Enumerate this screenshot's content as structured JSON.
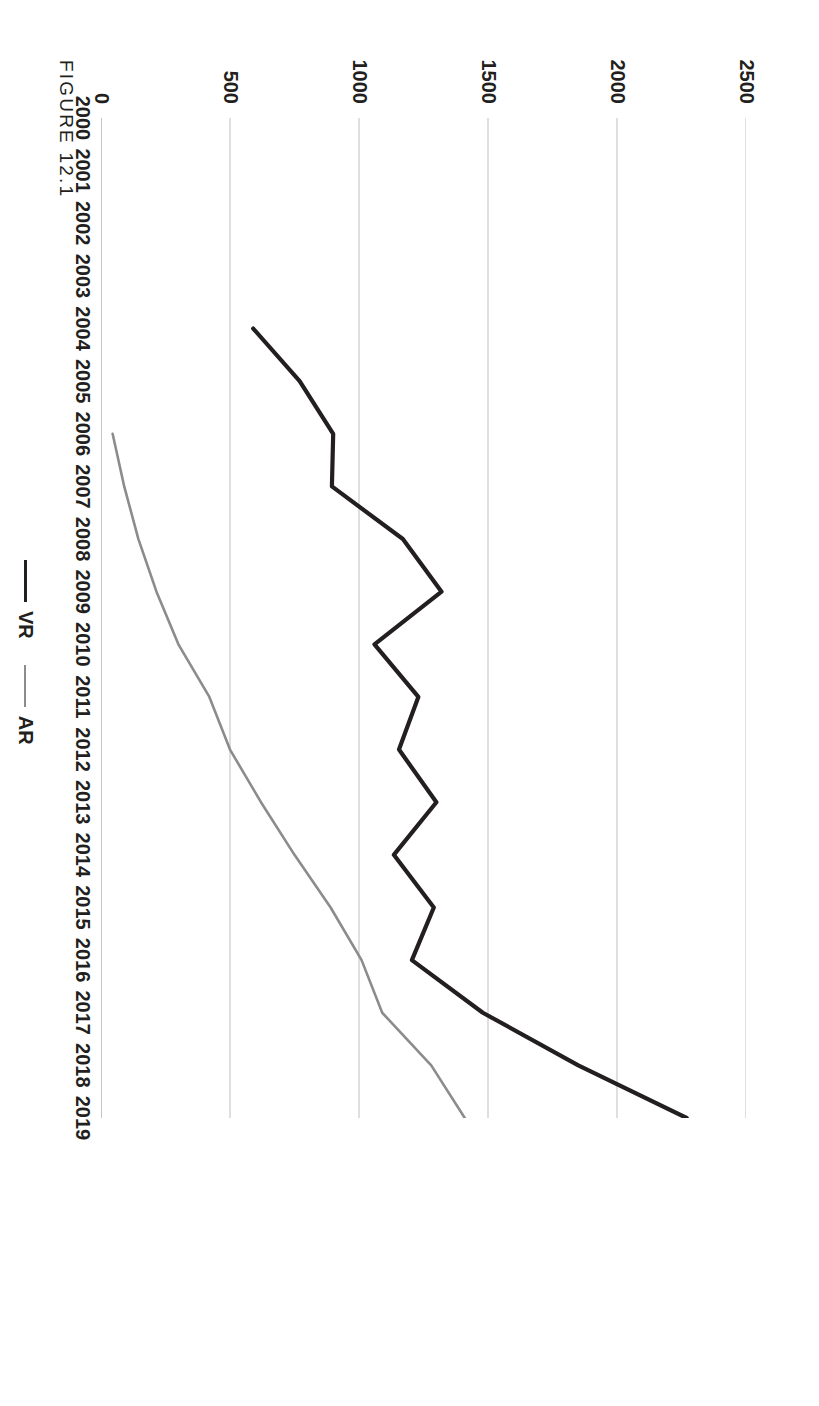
{
  "figure": {
    "label": "FIGURE 12.1"
  },
  "legend": {
    "position": "bottom-center",
    "items": [
      {
        "name": "VR",
        "color": "#231f20"
      },
      {
        "name": "AR",
        "color": "#8c8c8c"
      }
    ]
  },
  "chart_data": {
    "type": "line",
    "title": "",
    "xlabel": "",
    "ylabel": "",
    "grid": true,
    "ylim": [
      0,
      2500
    ],
    "yticks": [
      0,
      500,
      1000,
      1500,
      2000,
      2500
    ],
    "ytick_labels": [
      "0",
      "500",
      "1000",
      "1500",
      "2000",
      "2500"
    ],
    "categories": [
      "2000",
      "2001",
      "2002",
      "2003",
      "2004",
      "2005",
      "2006",
      "2007",
      "2008",
      "2009",
      "2010",
      "2011",
      "2012",
      "2013",
      "2014",
      "2015",
      "2016",
      "2017",
      "2018",
      "2019"
    ],
    "series": [
      {
        "name": "VR",
        "color": "#231f20",
        "x": [
          "2004",
          "2005",
          "2006",
          "2007",
          "2008",
          "2009",
          "2010",
          "2011",
          "2012",
          "2013",
          "2014",
          "2015",
          "2016",
          "2017",
          "2018",
          "2019"
        ],
        "values": [
          590,
          770,
          900,
          895,
          1170,
          1320,
          1060,
          1230,
          1155,
          1300,
          1135,
          1290,
          1205,
          1480,
          1850,
          2270
        ]
      },
      {
        "name": "AR",
        "color": "#8c8c8c",
        "x": [
          "2006",
          "2007",
          "2008",
          "2009",
          "2010",
          "2011",
          "2012",
          "2013",
          "2014",
          "2015",
          "2016",
          "2017",
          "2018",
          "2019"
        ],
        "values": [
          45,
          90,
          145,
          215,
          300,
          420,
          500,
          620,
          750,
          890,
          1010,
          1090,
          1280,
          1410
        ]
      }
    ]
  }
}
